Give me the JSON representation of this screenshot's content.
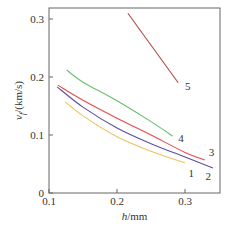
{
  "chart_data": {
    "type": "line",
    "title": "",
    "xlabel": "h/mm",
    "xlabel_italic": "h",
    "xlabel_unit": "/mm",
    "ylabel": "v_f/(km/s)",
    "ylabel_main": "v",
    "ylabel_sub": "f",
    "ylabel_unit": "/(km/s)",
    "xlim": [
      0.1,
      0.35
    ],
    "ylim": [
      0,
      0.32
    ],
    "xticks": [
      0.1,
      0.2,
      0.3
    ],
    "xtick_labels": [
      "0.1",
      "0.2",
      "0.3"
    ],
    "yticks": [
      0,
      0.1,
      0.2,
      0.3
    ],
    "ytick_labels": [
      "0",
      "0.1",
      "0.2",
      "0.3"
    ],
    "grid": false,
    "legend": "inline labels at curve ends",
    "series": [
      {
        "name": "1",
        "color": "#f0c060",
        "x": [
          0.124,
          0.15,
          0.2,
          0.25,
          0.3
        ],
        "values": [
          0.157,
          0.133,
          0.097,
          0.072,
          0.052
        ]
      },
      {
        "name": "2",
        "color": "#5a4fa0",
        "x": [
          0.112,
          0.15,
          0.2,
          0.25,
          0.3,
          0.341
        ],
        "values": [
          0.183,
          0.148,
          0.112,
          0.085,
          0.062,
          0.043
        ]
      },
      {
        "name": "3",
        "color": "#e84a4a",
        "x": [
          0.113,
          0.15,
          0.2,
          0.25,
          0.3,
          0.329
        ],
        "values": [
          0.186,
          0.16,
          0.129,
          0.1,
          0.07,
          0.057
        ]
      },
      {
        "name": "4",
        "color": "#6bbf6b",
        "x": [
          0.126,
          0.15,
          0.2,
          0.25,
          0.282
        ],
        "values": [
          0.212,
          0.191,
          0.159,
          0.123,
          0.098
        ]
      },
      {
        "name": "5",
        "color": "#b04a40",
        "x": [
          0.216,
          0.29
        ],
        "values": [
          0.31,
          0.19
        ]
      }
    ],
    "labels": [
      {
        "text": "1",
        "x": 0.305,
        "y": 0.035
      },
      {
        "text": "2",
        "x": 0.33,
        "y": 0.03
      },
      {
        "text": "3",
        "x": 0.335,
        "y": 0.07
      },
      {
        "text": "4",
        "x": 0.29,
        "y": 0.095
      },
      {
        "text": "5",
        "x": 0.3,
        "y": 0.185
      }
    ]
  }
}
